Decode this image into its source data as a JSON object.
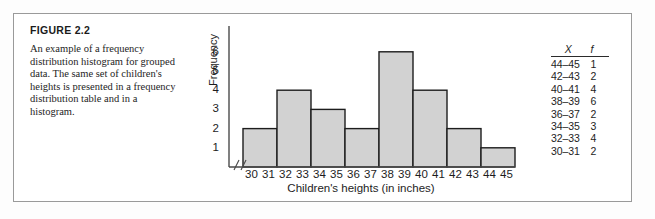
{
  "figure": {
    "number_label": "FIGURE 2.2",
    "caption": "An example of a frequency distribution histogram for grouped data. The same set of children's heights is presented in a frequency distribution table and in a histogram."
  },
  "chart_data": {
    "type": "bar",
    "title": "",
    "xlabel": "Children's heights (in inches)",
    "ylabel": "Frequency",
    "categories": [
      "30–31",
      "32–33",
      "34–35",
      "36–37",
      "38–39",
      "40–41",
      "42–43",
      "44–45"
    ],
    "values": [
      2,
      4,
      3,
      2,
      6,
      4,
      2,
      1
    ],
    "x_tick_labels": [
      "30",
      "31",
      "32",
      "33",
      "34",
      "35",
      "36",
      "37",
      "38",
      "39",
      "40",
      "41",
      "42",
      "43",
      "44",
      "45"
    ],
    "y_tick_labels": [
      "1",
      "2",
      "3",
      "4",
      "5",
      "6"
    ],
    "ylim": [
      0,
      6.6
    ],
    "xlim": [
      29.5,
      45.5
    ],
    "grid": false,
    "legend": false,
    "axis_break": true,
    "bar_fill_color": "#d2d2d2",
    "bar_edge_color": "#1d1d1d",
    "axis_color": "#4a4a4a"
  },
  "frequency_table": {
    "headers": [
      "X",
      "f"
    ],
    "rows": [
      {
        "x": "44–45",
        "f": "1"
      },
      {
        "x": "42–43",
        "f": "2"
      },
      {
        "x": "40–41",
        "f": "4"
      },
      {
        "x": "38–39",
        "f": "6"
      },
      {
        "x": "36–37",
        "f": "2"
      },
      {
        "x": "34–35",
        "f": "3"
      },
      {
        "x": "32–33",
        "f": "4"
      },
      {
        "x": "30–31",
        "f": "2"
      }
    ]
  }
}
